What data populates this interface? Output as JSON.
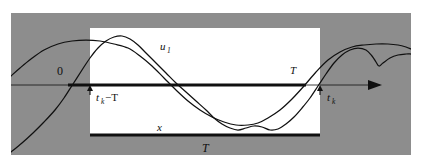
{
  "figure": {
    "type": "signal-diagram",
    "background_color": "#ffffff",
    "panel_color": "#8d8d8d",
    "window_color": "#ffffff",
    "ink_color": "#101010",
    "panel": {
      "x": 11,
      "y": 13,
      "width": 400,
      "height": 142
    },
    "window": {
      "x": 90,
      "y": 28,
      "width": 230,
      "height": 107
    },
    "axis": {
      "y": 85,
      "thin_start_x": 11,
      "thin_end_x": 380,
      "thick_start_x": 68,
      "thick_end_x": 306,
      "arrow_tip_x": 382
    },
    "interval_bar": {
      "x1": 90,
      "x2": 320,
      "y": 135
    },
    "ticks": [
      {
        "name": "tk-minus-T",
        "x": 90,
        "direction": "up"
      },
      {
        "name": "tk",
        "x": 320,
        "direction": "up"
      }
    ],
    "labels": [
      {
        "name": "origin-label",
        "text": "0",
        "x": 57,
        "y": 75,
        "style": "upright"
      },
      {
        "name": "u1-label",
        "text": "u",
        "sub": "1",
        "x": 160,
        "y": 50,
        "style": "italic"
      },
      {
        "name": "x-label",
        "text": "x",
        "x": 157,
        "y": 131,
        "style": "italic"
      },
      {
        "name": "tk-minus-T-label",
        "text": "t",
        "sub": "k",
        "suffix": "−T",
        "x": 96,
        "y": 101,
        "style": "italic"
      },
      {
        "name": "tk-label",
        "text": "t",
        "sub": "k",
        "x": 327,
        "y": 101,
        "style": "italic"
      },
      {
        "name": "period-right-label",
        "text": "T",
        "x": 290,
        "y": 74,
        "style": "italic"
      },
      {
        "name": "period-bottom-label",
        "text": "T",
        "x": 202,
        "y": 152,
        "style": "italic"
      }
    ]
  },
  "chart_data": {
    "type": "line",
    "title": "",
    "xlabel": "",
    "ylabel": "",
    "grid": false,
    "legend": "inline-annotations",
    "axis_baseline_y": 85,
    "annotations": [
      "0",
      "u1",
      "x",
      "tk-T",
      "tk",
      "T",
      "T"
    ],
    "series": [
      {
        "name": "u1",
        "label": "u₁",
        "points": [
          [
            11,
            76
          ],
          [
            20,
            68
          ],
          [
            31,
            59
          ],
          [
            44,
            50
          ],
          [
            58,
            44
          ],
          [
            72,
            41
          ],
          [
            86,
            40
          ],
          [
            100,
            41
          ],
          [
            114,
            44
          ],
          [
            128,
            48
          ],
          [
            140,
            56
          ],
          [
            152,
            66
          ],
          [
            164,
            78
          ],
          [
            176,
            90
          ],
          [
            188,
            101
          ],
          [
            200,
            110
          ],
          [
            212,
            117
          ],
          [
            224,
            122
          ],
          [
            236,
            125
          ],
          [
            248,
            125
          ],
          [
            258,
            123
          ],
          [
            268,
            118
          ],
          [
            280,
            110
          ],
          [
            292,
            99
          ],
          [
            304,
            86
          ],
          [
            316,
            72
          ],
          [
            328,
            60
          ],
          [
            340,
            52
          ],
          [
            352,
            47
          ],
          [
            364,
            45
          ],
          [
            376,
            44
          ],
          [
            388,
            44
          ],
          [
            398,
            45
          ],
          [
            406,
            47
          ],
          [
            411,
            49
          ]
        ]
      },
      {
        "name": "x",
        "label": "x",
        "points": [
          [
            11,
            152
          ],
          [
            22,
            143
          ],
          [
            33,
            133
          ],
          [
            44,
            122
          ],
          [
            55,
            110
          ],
          [
            64,
            98
          ],
          [
            73,
            84
          ],
          [
            82,
            70
          ],
          [
            90,
            58
          ],
          [
            98,
            48
          ],
          [
            106,
            41
          ],
          [
            114,
            37
          ],
          [
            122,
            36
          ],
          [
            130,
            39
          ],
          [
            138,
            45
          ],
          [
            146,
            53
          ],
          [
            156,
            63
          ],
          [
            166,
            73
          ],
          [
            176,
            83
          ],
          [
            186,
            92
          ],
          [
            196,
            101
          ],
          [
            206,
            110
          ],
          [
            214,
            118
          ],
          [
            222,
            124
          ],
          [
            230,
            128
          ],
          [
            238,
            130
          ],
          [
            246,
            128
          ],
          [
            254,
            126
          ],
          [
            262,
            127
          ],
          [
            270,
            130
          ],
          [
            278,
            129
          ],
          [
            286,
            124
          ],
          [
            294,
            117
          ],
          [
            302,
            108
          ],
          [
            310,
            98
          ],
          [
            318,
            86
          ],
          [
            326,
            74
          ],
          [
            334,
            63
          ],
          [
            342,
            55
          ],
          [
            350,
            50
          ],
          [
            358,
            48
          ],
          [
            366,
            50
          ],
          [
            372,
            56
          ],
          [
            376,
            62
          ],
          [
            379,
            66
          ],
          [
            383,
            63
          ],
          [
            390,
            58
          ],
          [
            398,
            55
          ],
          [
            406,
            54
          ],
          [
            411,
            54
          ]
        ]
      }
    ]
  }
}
